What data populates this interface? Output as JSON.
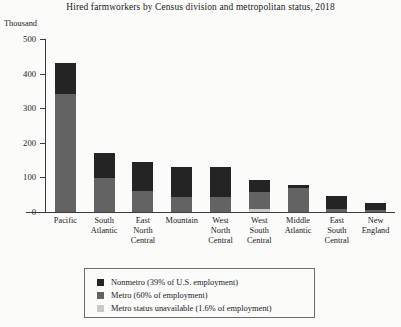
{
  "chart_data": {
    "type": "bar",
    "subtype": "stacked",
    "title": "Hired farmworkers by Census division and metropolitan status, 2018",
    "xlabel": "",
    "ylabel": "Thousand",
    "ylim": [
      0,
      500
    ],
    "yticks": [
      0,
      100,
      200,
      300,
      400,
      500
    ],
    "ytick_labels": [
      "0",
      "100",
      "200",
      "300",
      "400",
      "500"
    ],
    "grid": false,
    "legend_position": "bottom",
    "categories": [
      "Pacific",
      "South Atlantic",
      "East North Central",
      "Mountain",
      "West North Central",
      "West South Central",
      "Middle Atlantic",
      "East South Central",
      "New England"
    ],
    "category_lines": [
      [
        "Pacific"
      ],
      [
        "South",
        "Atlantic"
      ],
      [
        "East",
        "North",
        "Central"
      ],
      [
        "Mountain"
      ],
      [
        "West",
        "North",
        "Central"
      ],
      [
        "West",
        "South",
        "Central"
      ],
      [
        "Middle",
        "Atlantic"
      ],
      [
        "East",
        "South",
        "Central"
      ],
      [
        "New",
        "England"
      ]
    ],
    "series": [
      {
        "name": "Metro status unavailable (1.6% of employment)",
        "key": "unavail",
        "color": "#c9c9c9",
        "values": [
          0,
          0,
          0,
          0,
          0,
          8,
          0,
          0,
          0
        ]
      },
      {
        "name": "Metro (60% of employment)",
        "key": "metro",
        "color": "#636363",
        "values": [
          340,
          98,
          62,
          42,
          42,
          50,
          68,
          10,
          6
        ]
      },
      {
        "name": "Nonmetro (39% of U.S. employment)",
        "key": "nonmetro",
        "color": "#242424",
        "values": [
          90,
          74,
          82,
          88,
          88,
          35,
          10,
          35,
          19
        ]
      }
    ],
    "totals": [
      430,
      172,
      144,
      130,
      130,
      93,
      78,
      45,
      25
    ]
  },
  "legend": {
    "items": [
      {
        "label": "Nonmetro (39% of U.S. employment)",
        "color": "#242424",
        "key": "nonmetro"
      },
      {
        "label": "Metro (60% of employment)",
        "color": "#636363",
        "key": "metro"
      },
      {
        "label": "Metro status unavailable (1.6% of employment)",
        "color": "#c9c9c9",
        "key": "unavail"
      }
    ]
  }
}
